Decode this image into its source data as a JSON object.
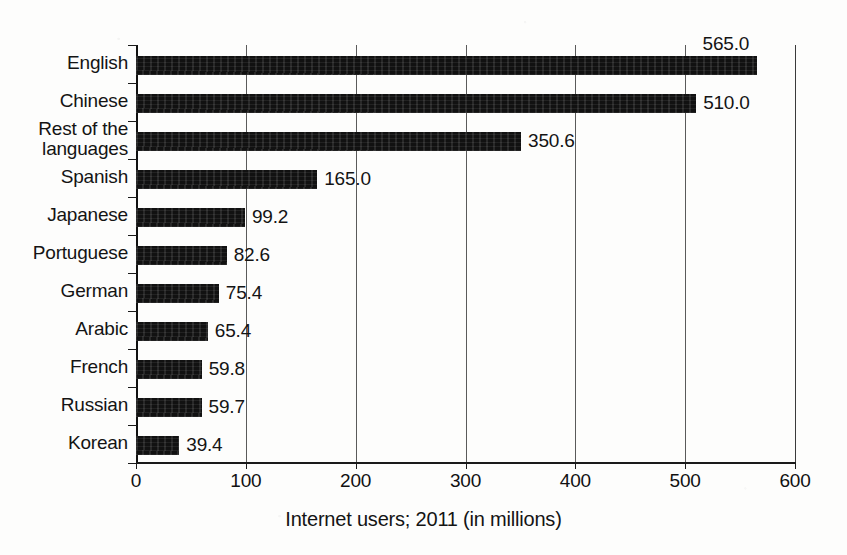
{
  "chart_data": {
    "type": "bar",
    "orientation": "horizontal",
    "title": "",
    "xlabel": "Internet users; 2011 (in millions)",
    "ylabel": "",
    "xlim": [
      0,
      600
    ],
    "xticks": [
      0,
      100,
      200,
      300,
      400,
      500,
      600
    ],
    "xtick_labels": [
      "0",
      "100",
      "200",
      "300",
      "400",
      "500",
      "600"
    ],
    "grid": "vertical",
    "legend": "none",
    "bar_color": "#111111",
    "categories": [
      "English",
      "Chinese",
      "Rest of the\nlanguages",
      "Spanish",
      "Japanese",
      "Portuguese",
      "German",
      "Arabic",
      "French",
      "Russian",
      "Korean"
    ],
    "values": [
      565.0,
      510.0,
      350.6,
      165.0,
      99.2,
      82.6,
      75.4,
      65.4,
      59.8,
      59.7,
      39.4
    ],
    "value_labels": [
      "565.0",
      "510.0",
      "350.6",
      "165.0",
      "99.2",
      "82.6",
      "75.4",
      "65.4",
      "59.8",
      "59.7",
      "39.4"
    ]
  }
}
